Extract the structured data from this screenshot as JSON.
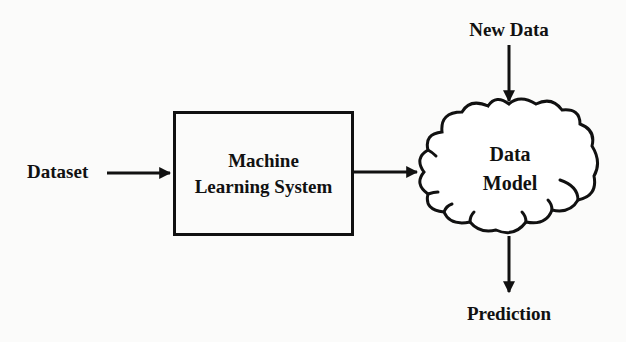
{
  "diagram": {
    "type": "flowchart",
    "nodes": {
      "dataset": {
        "label": "Dataset"
      },
      "ml_system": {
        "label_line1": "Machine",
        "label_line2": "Learning System"
      },
      "data_model": {
        "label_line1": "Data",
        "label_line2": "Model",
        "shape": "cloud"
      },
      "new_data": {
        "label": "New Data"
      },
      "prediction": {
        "label": "Prediction"
      }
    },
    "edges": [
      {
        "from": "Dataset",
        "to": "Machine Learning System"
      },
      {
        "from": "Machine Learning System",
        "to": "Data Model"
      },
      {
        "from": "New Data",
        "to": "Data Model"
      },
      {
        "from": "Data Model",
        "to": "Prediction"
      }
    ],
    "colors": {
      "stroke": "#111111",
      "background": "#fbfbfa",
      "text": "#111111"
    }
  }
}
